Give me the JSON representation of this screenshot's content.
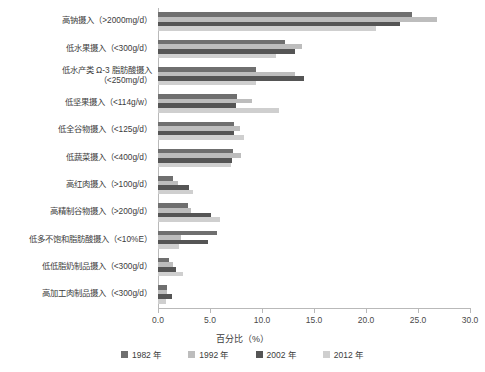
{
  "chart_data": {
    "type": "bar",
    "orientation": "horizontal",
    "title": "",
    "xlabel": "百分比（%）",
    "ylabel": "",
    "xlim": [
      0.0,
      30.0
    ],
    "xticks": [
      "0.0",
      "5.0",
      "10.0",
      "15.0",
      "20.0",
      "25.0",
      "30.0"
    ],
    "grid": false,
    "legend_position": "bottom",
    "categories": [
      "高钠摄入（>2000mg/d）",
      "低水果摄入（<300g/d）",
      "低水产类 Ω-3 脂肪酸摄入\n（<250mg/d）",
      "低坚果摄入（<114g/w）",
      "低全谷物摄入（<125g/d）",
      "低蔬菜摄入（<400g/d）",
      "高红肉摄入（>100g/d）",
      "高精制谷物摄入（>200g/d）",
      "低多不饱和脂肪酸摄入（<10%E）",
      "低低脂奶制品摄入（<300g/d）",
      "高加工肉制品摄入（<300g/d）"
    ],
    "series": [
      {
        "name": "1982 年",
        "color": "#6f6f6f",
        "values": [
          24.4,
          12.2,
          9.4,
          7.6,
          7.3,
          7.2,
          1.4,
          2.9,
          5.7,
          1.1,
          0.9
        ]
      },
      {
        "name": "1992 年",
        "color": "#bdbdbd",
        "values": [
          26.8,
          13.8,
          13.2,
          9.0,
          7.9,
          8.0,
          1.9,
          3.2,
          2.2,
          1.4,
          0.9
        ]
      },
      {
        "name": "2002 年",
        "color": "#555555",
        "values": [
          23.3,
          13.2,
          14.0,
          7.5,
          7.3,
          7.1,
          3.0,
          5.1,
          4.8,
          1.7,
          1.3
        ]
      },
      {
        "name": "2012 年",
        "color": "#cfcfcf",
        "values": [
          21.0,
          11.3,
          9.4,
          11.6,
          8.3,
          7.0,
          3.4,
          6.0,
          2.0,
          2.4,
          0.8
        ]
      }
    ]
  },
  "legend": {
    "items": [
      {
        "label": "1982 年",
        "color": "#6f6f6f"
      },
      {
        "label": "1992 年",
        "color": "#bdbdbd"
      },
      {
        "label": "2002 年",
        "color": "#555555"
      },
      {
        "label": "2012 年",
        "color": "#cfcfcf"
      }
    ]
  },
  "axis": {
    "x_title": "百分比（%）",
    "ticks": [
      "0.0",
      "5.0",
      "10.0",
      "15.0",
      "20.0",
      "25.0",
      "30.0"
    ]
  }
}
